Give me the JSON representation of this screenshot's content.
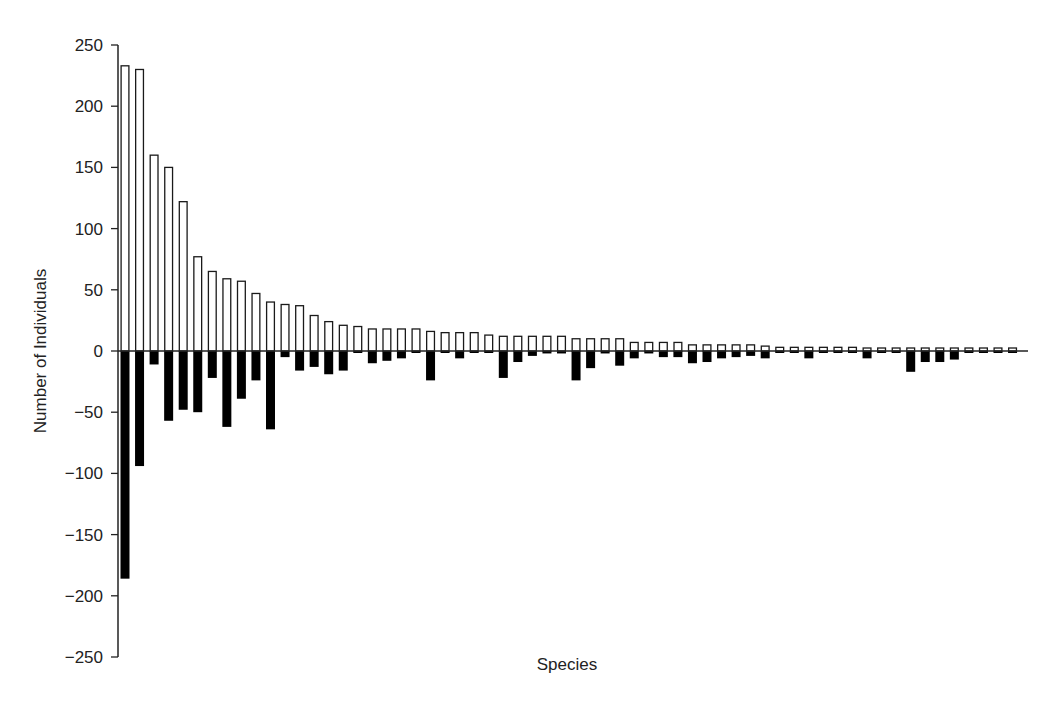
{
  "chart_data": {
    "type": "bar",
    "title": "",
    "xlabel": "Species",
    "ylabel": "Number of Individuals",
    "ylim": [
      -250,
      250
    ],
    "yticks": [
      250,
      200,
      150,
      100,
      50,
      0,
      -50,
      -100,
      -150,
      -200,
      -250
    ],
    "ytick_labels": [
      "250",
      "200",
      "150",
      "100",
      "50",
      "0",
      "−50",
      "−100",
      "−150",
      "−200",
      "−250"
    ],
    "grid": false,
    "legend": null,
    "x_tick_labels": false,
    "categories_count": 62,
    "series": [
      {
        "name": "positive (open bars)",
        "style": "white fill, black outline",
        "values": [
          233,
          230,
          160,
          150,
          122,
          77,
          65,
          59,
          57,
          47,
          40,
          38,
          37,
          29,
          24,
          21,
          20,
          18,
          18,
          18,
          18,
          16,
          15,
          15,
          15,
          13,
          12,
          12,
          12,
          12,
          12,
          10,
          10,
          10,
          10,
          7,
          7,
          7,
          7,
          5,
          5,
          5,
          5,
          5,
          4,
          3,
          3,
          3,
          3,
          3,
          3,
          1,
          1,
          1,
          1,
          1,
          1,
          1,
          1,
          1,
          1,
          1
        ]
      },
      {
        "name": "negative (filled bars)",
        "style": "black fill",
        "values": [
          -186,
          -94,
          -11,
          -57,
          -48,
          -50,
          -22,
          -62,
          -39,
          -24,
          -64,
          -5,
          -16,
          -13,
          -19,
          -16,
          -1,
          -10,
          -8,
          -6,
          -1,
          -24,
          -1,
          -6,
          -1,
          -1,
          -22,
          -9,
          -4,
          -2,
          -2,
          -24,
          -14,
          -2,
          -12,
          -6,
          -2,
          -5,
          -5,
          -10,
          -9,
          -6,
          -5,
          -4,
          -6,
          -1,
          -1,
          -6,
          -1,
          -1,
          -1,
          -6,
          -1,
          -1,
          -17,
          -9,
          -9,
          -7,
          -1,
          -1,
          -1,
          -1
        ]
      }
    ]
  },
  "axes": {
    "x_title": "Species",
    "y_title": "Number of Individuals"
  },
  "colors": {
    "positive_fill": "#ffffff",
    "negative_fill": "#000000",
    "stroke": "#1a1a1a",
    "axis": "#222222"
  }
}
